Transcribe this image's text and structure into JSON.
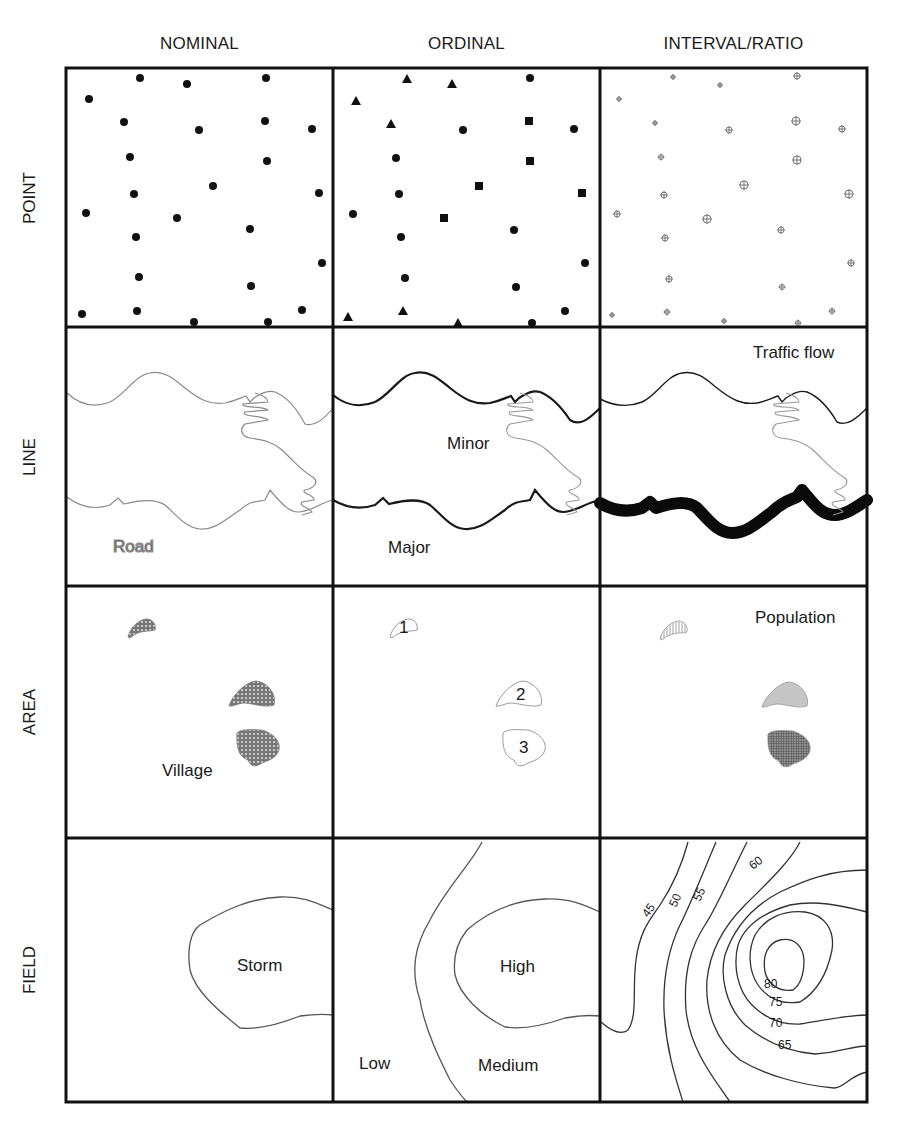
{
  "columns": [
    {
      "label": "NOMINAL"
    },
    {
      "label": "ORDINAL"
    },
    {
      "label": "INTERVAL/RATIO"
    }
  ],
  "rows": [
    {
      "label": "POINT"
    },
    {
      "label": "LINE"
    },
    {
      "label": "AREA"
    },
    {
      "label": "FIELD"
    }
  ],
  "cells": {
    "line_nominal": {
      "label": "Road"
    },
    "line_ordinal": {
      "label_minor": "Minor",
      "label_major": "Major"
    },
    "line_interval": {
      "label": "Traffic flow"
    },
    "area_nominal": {
      "label": "Village"
    },
    "area_ordinal": {
      "ranks": [
        "1",
        "2",
        "3"
      ]
    },
    "area_interval": {
      "label": "Population"
    },
    "field_nominal": {
      "label": "Storm"
    },
    "field_ordinal": {
      "label_high": "High",
      "label_medium": "Medium",
      "label_low": "Low"
    },
    "field_interval": {
      "contours": [
        "45",
        "50",
        "55",
        "60",
        "65",
        "70",
        "75",
        "80"
      ]
    }
  },
  "colors": {
    "ink": "#1a1a1a",
    "grey_line": "#8a8a8a",
    "frame": "#111111"
  }
}
